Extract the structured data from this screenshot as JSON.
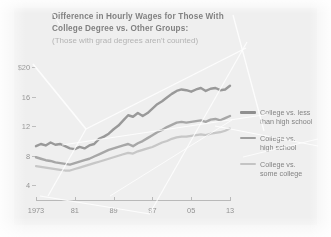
{
  "chart_data": {
    "type": "line",
    "title": "Difference in Hourly Wages for Those With College Degree vs. Other Groups:",
    "title_line1": "Difference in Hourly Wages for Those With",
    "title_line2": "College Degree vs. Other Groups:",
    "subtitle": "(Those with grad degrees aren't counted)",
    "xlabel": "",
    "ylabel": "",
    "grid": false,
    "legend_position": "right",
    "xlim": [
      1973,
      2013
    ],
    "ylim": [
      2,
      21
    ],
    "y_ticks": [
      "$20",
      "16",
      "12",
      "8",
      "4"
    ],
    "y_tick_values": [
      20,
      16,
      12,
      8,
      4
    ],
    "x_ticks": [
      "1973",
      "81",
      "89",
      "97",
      "05",
      "13"
    ],
    "x_tick_values": [
      1973,
      1981,
      1989,
      1997,
      2005,
      2013
    ],
    "x": [
      1973,
      1974,
      1975,
      1976,
      1977,
      1978,
      1979,
      1980,
      1981,
      1982,
      1983,
      1984,
      1985,
      1986,
      1987,
      1988,
      1989,
      1990,
      1991,
      1992,
      1993,
      1994,
      1995,
      1996,
      1997,
      1998,
      1999,
      2000,
      2001,
      2002,
      2003,
      2004,
      2005,
      2006,
      2007,
      2008,
      2009,
      2010,
      2011,
      2012,
      2013
    ],
    "series": [
      {
        "name": "College vs. less than high school",
        "color": "#8f8f8f",
        "values": [
          9.3,
          9.6,
          9.4,
          9.8,
          9.5,
          9.6,
          9.3,
          9.0,
          8.9,
          9.2,
          9.0,
          9.4,
          9.6,
          10.3,
          10.6,
          11.0,
          11.6,
          12.1,
          12.8,
          13.5,
          13.3,
          13.8,
          13.4,
          13.8,
          14.4,
          15.0,
          15.4,
          15.9,
          16.4,
          16.8,
          17.0,
          16.9,
          16.7,
          17.0,
          17.2,
          16.8,
          17.1,
          17.2,
          16.9,
          17.0,
          17.5
        ]
      },
      {
        "name": "College vs. high school",
        "color": "#9e9e9e",
        "values": [
          7.8,
          7.6,
          7.4,
          7.3,
          7.1,
          7.0,
          6.9,
          6.8,
          7.0,
          7.2,
          7.4,
          7.6,
          7.9,
          8.2,
          8.5,
          8.8,
          9.0,
          9.2,
          9.4,
          9.6,
          9.3,
          9.7,
          10.0,
          10.4,
          10.8,
          11.2,
          11.5,
          11.9,
          12.2,
          12.5,
          12.6,
          12.5,
          12.6,
          12.7,
          12.8,
          12.6,
          12.9,
          13.0,
          12.8,
          13.1,
          13.4
        ]
      },
      {
        "name": "College vs. some college",
        "color": "#c4c4c4",
        "values": [
          6.6,
          6.5,
          6.4,
          6.3,
          6.2,
          6.1,
          6.0,
          6.0,
          6.2,
          6.4,
          6.6,
          6.8,
          7.0,
          7.2,
          7.4,
          7.6,
          7.8,
          8.0,
          8.2,
          8.4,
          8.3,
          8.6,
          8.8,
          9.0,
          9.2,
          9.5,
          9.8,
          10.0,
          10.3,
          10.5,
          10.6,
          10.6,
          10.7,
          10.8,
          10.9,
          10.8,
          11.0,
          11.1,
          11.2,
          11.4,
          11.7
        ]
      }
    ]
  },
  "legend": {
    "items": [
      {
        "line1": "College vs. less",
        "line2": "than high school",
        "color": "#8f8f8f"
      },
      {
        "line1": "College vs.",
        "line2": "high school",
        "color": "#9e9e9e"
      },
      {
        "line1": "College vs.",
        "line2": "some college",
        "color": "#c4c4c4"
      }
    ]
  }
}
